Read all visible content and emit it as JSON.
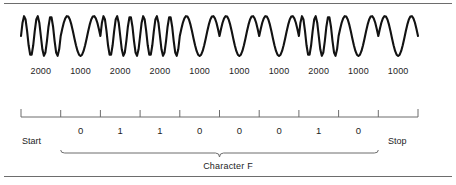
{
  "figure": {
    "line_color": "#121212",
    "rule_color": "#6d6d6d",
    "background": "#ffffff"
  },
  "frequency_row": {
    "unit_implied": "Hz",
    "labels": [
      "2000",
      "1000",
      "2000",
      "2000",
      "1000",
      "1000",
      "1000",
      "2000",
      "1000",
      "1000"
    ]
  },
  "bit_row": {
    "bits": [
      "0",
      "1",
      "1",
      "0",
      "0",
      "0",
      "1",
      "0"
    ],
    "start_label": "Start",
    "stop_label": "Stop"
  },
  "bracket": {
    "label": "Character F"
  },
  "ruler": {
    "tick_count": 11,
    "left_x": 21,
    "right_x": 418
  },
  "chart_data": {
    "type": "line",
    "xlabel": "",
    "ylabel": "",
    "grid": false,
    "legend": "none",
    "x": [
      0,
      1,
      2,
      3,
      4,
      5,
      6,
      7,
      8,
      9
    ],
    "categories": [
      "Start",
      "0",
      "1",
      "1",
      "0",
      "0",
      "0",
      "1",
      "0",
      "Stop"
    ],
    "series": [
      {
        "name": "Frequency (Hz)",
        "values": [
          2000,
          1000,
          2000,
          2000,
          1000,
          1000,
          1000,
          2000,
          1000,
          1000
        ]
      },
      {
        "name": "Bit value",
        "values": [
          null,
          0,
          1,
          1,
          0,
          0,
          0,
          1,
          0,
          null
        ]
      }
    ],
    "annotations": [
      "Start",
      "Stop",
      "Character F"
    ]
  }
}
